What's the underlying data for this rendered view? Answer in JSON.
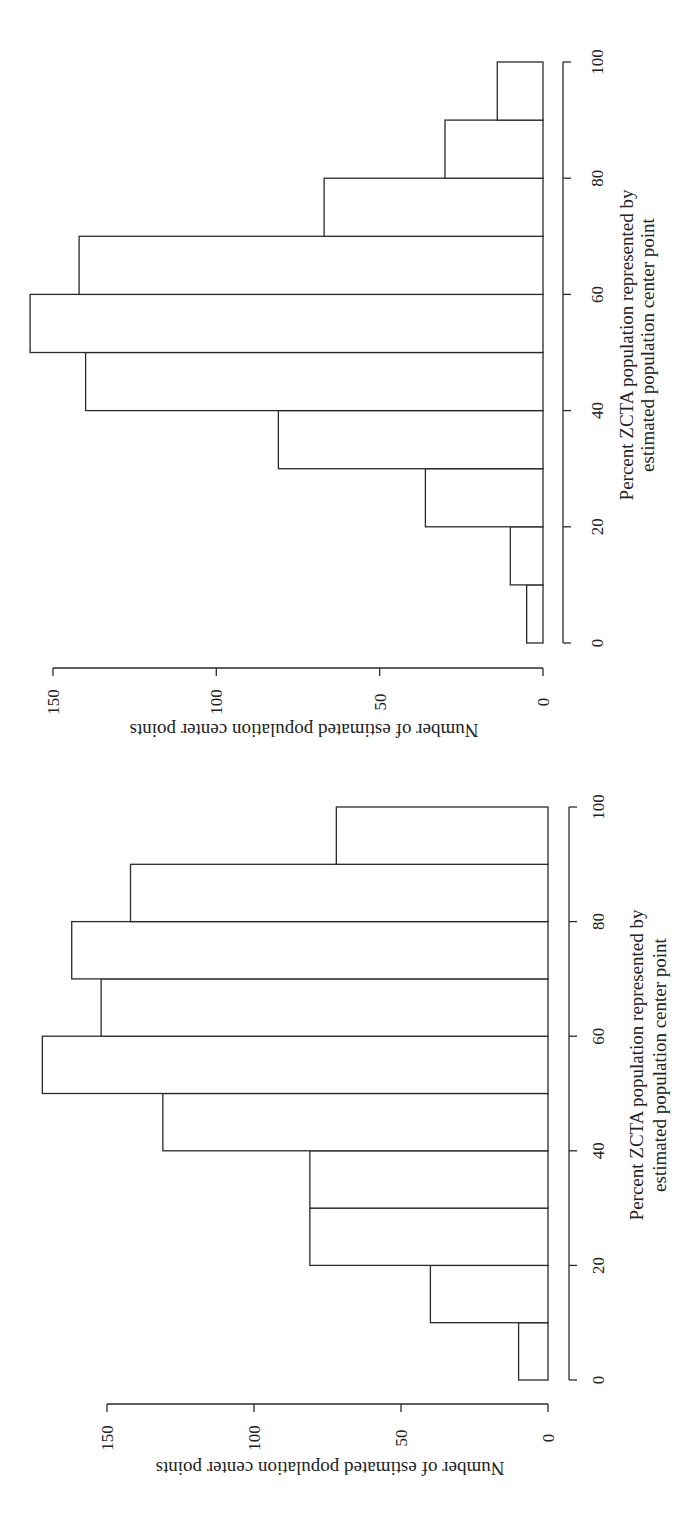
{
  "chart_data": [
    {
      "type": "bar",
      "orientation": "rotated-90-ccw histogram",
      "title": "",
      "categories": [
        "0-10",
        "10-20",
        "20-30",
        "30-40",
        "40-50",
        "50-60",
        "60-70",
        "70-80",
        "80-90",
        "90-100"
      ],
      "bin_edges": [
        0,
        10,
        20,
        30,
        40,
        50,
        60,
        70,
        80,
        90,
        100
      ],
      "values": [
        5,
        10,
        36,
        81,
        140,
        157,
        142,
        67,
        30,
        14
      ],
      "xlabel": "Percent ZCTA population represented by estimated population center point",
      "xlabel_lines": [
        "Percent ZCTA population represented by",
        "estimated population center point"
      ],
      "ylabel": "Number of estimated population center points",
      "xticks": [
        0,
        20,
        40,
        60,
        80,
        100
      ],
      "yticks": [
        0,
        50,
        100,
        150
      ],
      "xlim": [
        0,
        100
      ],
      "ylim": [
        0,
        150
      ],
      "grid": false,
      "legend": null
    },
    {
      "type": "bar",
      "orientation": "rotated-90-ccw histogram",
      "title": "",
      "categories": [
        "0-10",
        "10-20",
        "20-30",
        "30-40",
        "40-50",
        "50-60",
        "60-70",
        "70-80",
        "80-90",
        "90-100"
      ],
      "bin_edges": [
        0,
        10,
        20,
        30,
        40,
        50,
        60,
        70,
        80,
        90,
        100
      ],
      "values": [
        10,
        40,
        81,
        81,
        131,
        172,
        152,
        162,
        142,
        72
      ],
      "xlabel": "Percent ZCTA population represented by estimated population center point",
      "xlabel_lines": [
        "Percent ZCTA population represented by",
        "estimated population center point"
      ],
      "ylabel": "Number of estimated population center points",
      "xticks": [
        0,
        20,
        40,
        60,
        80,
        100
      ],
      "yticks": [
        0,
        50,
        100,
        150
      ],
      "xlim": [
        0,
        100
      ],
      "ylim": [
        0,
        150
      ],
      "grid": false,
      "legend": null
    }
  ],
  "panels": [
    {
      "id": "top",
      "xlabel_line1": "Percent ZCTA population represented by",
      "xlabel_line2": "estimated population center point",
      "ylabel": "Number of estimated population center points"
    },
    {
      "id": "bottom",
      "xlabel_line1": "Percent ZCTA population represented by",
      "xlabel_line2": "estimated population center point",
      "ylabel": "Number of estimated population center points"
    }
  ],
  "colors": {
    "bar_fill": "#ffffff",
    "bar_stroke": "#2a2a2a",
    "background": "#ffffff"
  }
}
